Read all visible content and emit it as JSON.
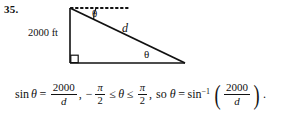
{
  "problem": {
    "number": "35."
  },
  "figure": {
    "type": "right-triangle-with-horizontal-dashed-ray",
    "height_label": "2000 ft",
    "hypotenuse_label": "d",
    "angle_top_label": "θ",
    "angle_bottom_label": "θ",
    "right_angle_marker": true,
    "dashed_ray": "horizontal dotted line from apex to the right",
    "geometry": {
      "apex": [
        70,
        8
      ],
      "bottom_left": [
        70,
        63
      ],
      "bottom_right": [
        185,
        63
      ],
      "dashed_end": [
        128,
        8
      ]
    },
    "stroke_color": "#111111"
  },
  "equation": {
    "sin_func": "sin",
    "theta": "θ",
    "equals": "=",
    "numerator_1": "2000",
    "denominator_1": "d",
    "comma_1": ",",
    "minus": "−",
    "pi": "π",
    "two": "2",
    "leq_1": "≤",
    "leq_2": "≤",
    "comma_2": ",",
    "so": "so",
    "equals_2": "=",
    "arcsin_func": "sin",
    "arcsin_exp": "−1",
    "open_paren": "(",
    "numerator_2": "2000",
    "denominator_2": "d",
    "close_paren": ")",
    "period": "."
  }
}
